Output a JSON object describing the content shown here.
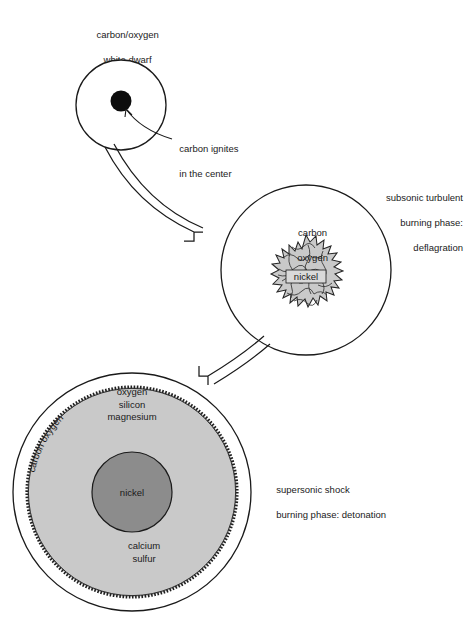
{
  "diagram": {
    "title_visible": false,
    "background": "#ffffff",
    "colors": {
      "stroke": "#1a1a1a",
      "ignition_spot": "#0d0d0d",
      "deflagration_blob": "#c9c9c9",
      "outer_shell": "#c9c9c9",
      "nickel_core": "#8c8c8c"
    }
  },
  "stage1": {
    "label_line1": "carbon/oxygen",
    "label_line2": "white dwarf",
    "callout_line1": "carbon ignites",
    "callout_line2": "in the center"
  },
  "stage2": {
    "interior_line1": "carbon",
    "interior_line2": "oxygen",
    "core_label": "nickel",
    "phase_line1": "subsonic turbulent",
    "phase_line2": "burning phase:",
    "phase_line3": "deflagration"
  },
  "stage3": {
    "curved_label": "carbon oxygen",
    "shell_line1": "oxygen",
    "shell_line2": "silicon",
    "shell_line3": "magnesium",
    "core_label": "nickel",
    "lower_line1": "calcium",
    "lower_line2": "sulfur",
    "phase_line1": "supersonic shock",
    "phase_line2": "burning phase: detonation"
  },
  "arrows": {
    "arrow1_name": "stage1-to-stage2",
    "arrow2_name": "stage2-to-stage3"
  }
}
